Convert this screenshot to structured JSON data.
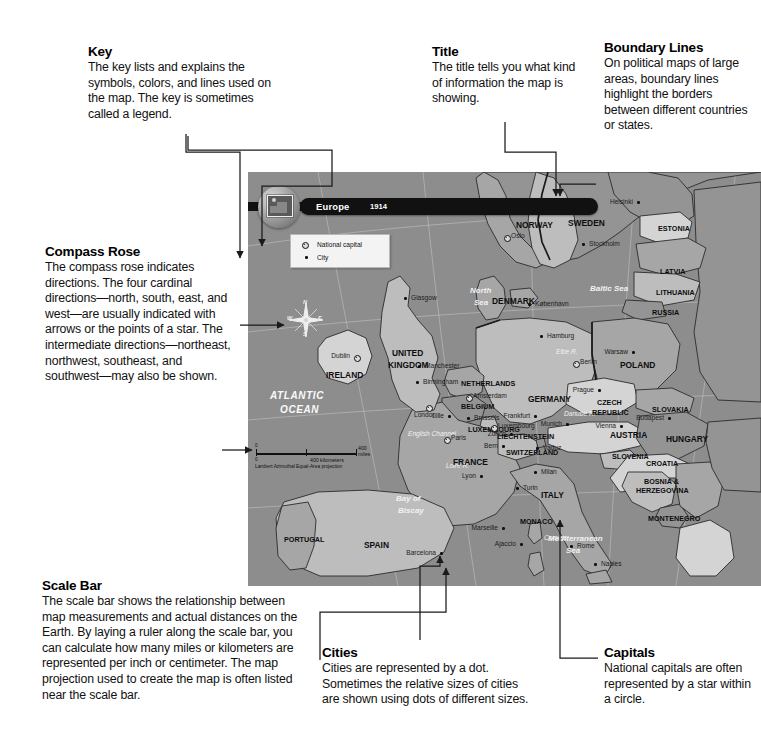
{
  "annotations": [
    {
      "id": "key",
      "title": "Key",
      "body": "The key lists and explains the symbols, colors, and lines used on the map. The key is sometimes called a legend."
    },
    {
      "id": "title",
      "title": "Title",
      "body": "The title tells you what kind of information the map is showing."
    },
    {
      "id": "boundary",
      "title": "Boundary Lines",
      "body": "On political maps of large areas, boundary lines highlight the borders between different countries or states."
    },
    {
      "id": "compass",
      "title": "Compass Rose",
      "body": "The compass rose indicates directions. The four cardinal directions—north, south, east, and west—are usually indicated with arrows or the points of a star. The intermediate directions—northeast, northwest, southeast, and southwest—may also be shown."
    },
    {
      "id": "scale",
      "title": "Scale Bar",
      "body": "The scale bar shows the relationship between map measurements and actual distances on the Earth. By laying a ruler along the scale bar, you can calculate how many miles or kilometers are represented per inch or centimeter. The map projection used to create the map is often listed near the scale bar."
    },
    {
      "id": "cities",
      "title": "Cities",
      "body": "Cities are represented by a dot. Sometimes the relative sizes of cities are shown using dots of different sizes."
    },
    {
      "id": "capitals",
      "title": "Capitals",
      "body": "National capitals are often represented by a star within a circle."
    }
  ],
  "map": {
    "banner_title": "Europe",
    "banner_year": "1914",
    "legend": {
      "capital_label": "National capital",
      "city_label": "City"
    },
    "compass": {
      "north": "N",
      "south": "S",
      "east": "E",
      "west": "W"
    },
    "scale": {
      "zero_top": "0",
      "zero_bottom": "0",
      "miles": "400 miles",
      "kilometers": "400 kilometers",
      "projection": "Lambert Azimuthal Equal-Area projection"
    },
    "countries": [
      {
        "name": "NORWAY",
        "x": 268,
        "y": 48,
        "size": "md"
      },
      {
        "name": "SWEDEN",
        "x": 320,
        "y": 46,
        "size": "md"
      },
      {
        "name": "ESTONIA",
        "x": 410,
        "y": 52,
        "size": "sm"
      },
      {
        "name": "LATVIA",
        "x": 412,
        "y": 95,
        "size": "sm"
      },
      {
        "name": "LITHUANIA",
        "x": 408,
        "y": 116,
        "size": "sm"
      },
      {
        "name": "RUSSIA",
        "x": 404,
        "y": 136,
        "size": "sm"
      },
      {
        "name": "DENMARK",
        "x": 244,
        "y": 124,
        "size": "md"
      },
      {
        "name": "POLAND",
        "x": 372,
        "y": 188,
        "size": "md"
      },
      {
        "name": "UNITED",
        "x": 144,
        "y": 176,
        "size": "md"
      },
      {
        "name": "KINGDOM",
        "x": 140,
        "y": 188,
        "size": "md"
      },
      {
        "name": "IRELAND",
        "x": 78,
        "y": 198,
        "size": "md"
      },
      {
        "name": "NETHERLANDS",
        "x": 213,
        "y": 207,
        "size": "sm"
      },
      {
        "name": "BELGIUM",
        "x": 213,
        "y": 230,
        "size": "sm"
      },
      {
        "name": "GERMANY",
        "x": 280,
        "y": 222,
        "size": "md"
      },
      {
        "name": "LUXEMBOURG",
        "x": 220,
        "y": 253,
        "size": "sm"
      },
      {
        "name": "CZECH",
        "x": 349,
        "y": 226,
        "size": "sm"
      },
      {
        "name": "REPUBLIC",
        "x": 344,
        "y": 236,
        "size": "sm"
      },
      {
        "name": "SLOVAKIA",
        "x": 404,
        "y": 233,
        "size": "sm"
      },
      {
        "name": "LIECHTENSTEIN",
        "x": 249,
        "y": 260,
        "size": "sm"
      },
      {
        "name": "AUSTRIA",
        "x": 362,
        "y": 258,
        "size": "md"
      },
      {
        "name": "HUNGARY",
        "x": 418,
        "y": 262,
        "size": "md"
      },
      {
        "name": "SWITZERLAND",
        "x": 258,
        "y": 276,
        "size": "sm"
      },
      {
        "name": "SLOVENIA",
        "x": 364,
        "y": 280,
        "size": "sm"
      },
      {
        "name": "CROATIA",
        "x": 398,
        "y": 287,
        "size": "sm"
      },
      {
        "name": "FRANCE",
        "x": 205,
        "y": 285,
        "size": "md"
      },
      {
        "name": "ITALY",
        "x": 293,
        "y": 318,
        "size": "md"
      },
      {
        "name": "BOSNIA &",
        "x": 396,
        "y": 305,
        "size": "sm"
      },
      {
        "name": "HERZEGOVINA",
        "x": 388,
        "y": 314,
        "size": "sm"
      },
      {
        "name": "MONTENEGRO",
        "x": 400,
        "y": 342,
        "size": "sm"
      },
      {
        "name": "MONACO",
        "x": 272,
        "y": 345,
        "size": "sm"
      },
      {
        "name": "PORTUGAL",
        "x": 36,
        "y": 363,
        "size": "sm"
      },
      {
        "name": "SPAIN",
        "x": 116,
        "y": 368,
        "size": "md"
      }
    ],
    "cities": [
      {
        "name": "Helsinki",
        "x": 389,
        "y": 26,
        "type": "city",
        "side": "left"
      },
      {
        "name": "Stockholm",
        "x": 334,
        "y": 68,
        "type": "city",
        "side": "right"
      },
      {
        "name": "Oslo",
        "x": 256,
        "y": 60,
        "type": "capital",
        "side": "right"
      },
      {
        "name": "København",
        "x": 280,
        "y": 128,
        "type": "city",
        "side": "right"
      },
      {
        "name": "Hamburg",
        "x": 292,
        "y": 160,
        "type": "city",
        "side": "right"
      },
      {
        "name": "Berlin",
        "x": 325,
        "y": 186,
        "type": "capital",
        "side": "right"
      },
      {
        "name": "Warsaw",
        "x": 384,
        "y": 176,
        "type": "city",
        "side": "left"
      },
      {
        "name": "Glasgow",
        "x": 156,
        "y": 122,
        "type": "city",
        "side": "right"
      },
      {
        "name": "Manchester",
        "x": 170,
        "y": 190,
        "type": "city",
        "side": "right"
      },
      {
        "name": "Birmingham",
        "x": 168,
        "y": 206,
        "type": "city",
        "side": "right"
      },
      {
        "name": "London",
        "x": 178,
        "y": 230,
        "type": "capital",
        "side": "below"
      },
      {
        "name": "Dublin",
        "x": 106,
        "y": 180,
        "type": "capital",
        "side": "left"
      },
      {
        "name": "Amsterdam",
        "x": 218,
        "y": 220,
        "type": "capital",
        "side": "right"
      },
      {
        "name": "Brussels",
        "x": 219,
        "y": 242,
        "type": "city",
        "side": "right"
      },
      {
        "name": "Lille",
        "x": 200,
        "y": 240,
        "type": "city",
        "side": "left"
      },
      {
        "name": "Paris",
        "x": 196,
        "y": 262,
        "type": "capital",
        "side": "right"
      },
      {
        "name": "Luxembourg",
        "x": 243,
        "y": 250,
        "type": "capital",
        "side": "right"
      },
      {
        "name": "Frankfurt",
        "x": 286,
        "y": 240,
        "type": "city",
        "side": "left"
      },
      {
        "name": "Prague",
        "x": 350,
        "y": 214,
        "type": "city",
        "side": "left"
      },
      {
        "name": "Munich",
        "x": 318,
        "y": 248,
        "type": "city",
        "side": "left"
      },
      {
        "name": "Vienna",
        "x": 372,
        "y": 250,
        "type": "city",
        "side": "left"
      },
      {
        "name": "Budapest",
        "x": 420,
        "y": 242,
        "type": "city",
        "side": "left"
      },
      {
        "name": "Bern",
        "x": 254,
        "y": 270,
        "type": "city",
        "side": "left"
      },
      {
        "name": "Vaduz",
        "x": 288,
        "y": 272,
        "type": "city",
        "side": "right"
      },
      {
        "name": "Zurich",
        "x": 262,
        "y": 258,
        "type": "city",
        "side": "left"
      },
      {
        "name": "Lyon",
        "x": 232,
        "y": 300,
        "type": "city",
        "side": "left"
      },
      {
        "name": "Milan",
        "x": 286,
        "y": 296,
        "type": "city",
        "side": "right"
      },
      {
        "name": "Turin",
        "x": 268,
        "y": 312,
        "type": "city",
        "side": "right"
      },
      {
        "name": "Rome",
        "x": 322,
        "y": 370,
        "type": "city",
        "side": "right"
      },
      {
        "name": "Naples",
        "x": 346,
        "y": 388,
        "type": "city",
        "side": "right"
      },
      {
        "name": "Marseille",
        "x": 254,
        "y": 352,
        "type": "city",
        "side": "left"
      },
      {
        "name": "Barcelona",
        "x": 192,
        "y": 377,
        "type": "city",
        "side": "left"
      },
      {
        "name": "Ajaccio",
        "x": 272,
        "y": 368,
        "type": "city",
        "side": "left"
      }
    ],
    "water_labels": [
      {
        "name": "ATLANTIC",
        "x": 22,
        "y": 218,
        "cls": "ocean"
      },
      {
        "name": "OCEAN",
        "x": 32,
        "y": 232,
        "cls": "ocean"
      },
      {
        "name": "North",
        "x": 222,
        "y": 114,
        "cls": "water"
      },
      {
        "name": "Sea",
        "x": 226,
        "y": 126,
        "cls": "water"
      },
      {
        "name": "Baltic Sea",
        "x": 342,
        "y": 112,
        "cls": "water"
      },
      {
        "name": "English Channel",
        "x": 160,
        "y": 258,
        "cls": "water sm"
      },
      {
        "name": "Bay of",
        "x": 148,
        "y": 322,
        "cls": "water"
      },
      {
        "name": "Biscay",
        "x": 150,
        "y": 334,
        "cls": "water"
      },
      {
        "name": "Mediterranean",
        "x": 300,
        "y": 362,
        "cls": "water"
      },
      {
        "name": "Sea",
        "x": 318,
        "y": 374,
        "cls": "water"
      },
      {
        "name": "Corsica",
        "x": 296,
        "y": 362,
        "cls": "water sm"
      },
      {
        "name": "Loire R.",
        "x": 198,
        "y": 290,
        "cls": "water sm"
      },
      {
        "name": "Elbe R.",
        "x": 308,
        "y": 176,
        "cls": "water sm"
      },
      {
        "name": "Danube R.",
        "x": 316,
        "y": 238,
        "cls": "water sm"
      }
    ]
  }
}
